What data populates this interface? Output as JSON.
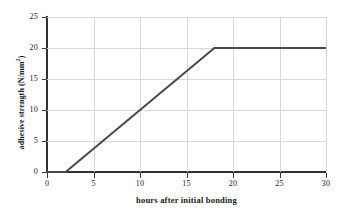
{
  "chart_data": {
    "type": "line",
    "title": "",
    "xlabel": "hours after initial bonding",
    "ylabel": "adhesive strength (N/mm",
    "ylabel_sup": "2",
    "ylabel_suffix": ")",
    "ylabel_full": "adhesive strength (N/mm²)",
    "xlim": [
      0,
      30
    ],
    "ylim": [
      0,
      25
    ],
    "xticks": [
      0,
      5,
      10,
      15,
      20,
      25,
      30
    ],
    "yticks": [
      0,
      5,
      10,
      15,
      20,
      25
    ],
    "xtick_labels": [
      "0",
      "5",
      "10",
      "15",
      "20",
      "25",
      "30"
    ],
    "ytick_labels": [
      "0",
      "5",
      "10",
      "15",
      "20",
      "25"
    ],
    "grid": true,
    "grid_color": "#d8d8d8",
    "legend": false,
    "line_color": "#4a4a4a",
    "line_width": 2,
    "series": [
      {
        "name": "adhesive strength",
        "x": [
          0,
          2,
          18,
          30
        ],
        "y": [
          0,
          0,
          20,
          20
        ]
      }
    ],
    "annotations": [
      {
        "label": "onset of strength gain",
        "x": 2,
        "y": 0
      },
      {
        "label": "full cure plateau",
        "x": 18,
        "y": 20
      }
    ]
  }
}
